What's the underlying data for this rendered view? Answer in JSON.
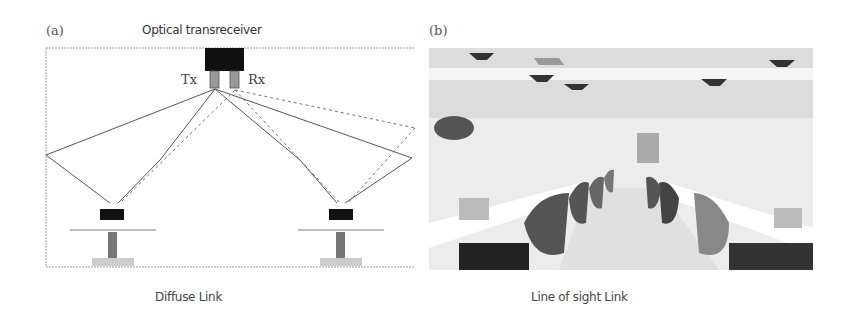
{
  "panel_a": {
    "label": "(a)",
    "title": "Optical transreceiver",
    "tx_label": "Tx",
    "rx_label": "Rx",
    "caption": "Diffuse Link"
  },
  "panel_b": {
    "label": "(b)",
    "caption": "Line of sight Link",
    "image_description": "office interior with desks, chairs and ceiling-mounted light fixtures"
  },
  "colors": {
    "line": "#555555",
    "dashed": "#777777",
    "device": "#111111",
    "frame": "#888888"
  }
}
